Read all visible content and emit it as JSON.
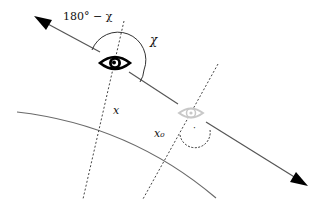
{
  "diagram": {
    "type": "geometry-illustration",
    "labels": {
      "supplement_angle": "180° − χ",
      "angle": "χ",
      "position": "x",
      "position_zero": "x₀",
      "right_angle_marker": "·"
    },
    "elements": {
      "observer_eye": "eye-icon",
      "faded_observer_eye": "eye-icon-faded",
      "line_of_sight": "arrow-line",
      "surface": "curve",
      "normal_at_x": "dotted-line",
      "normal_at_x0": "dotted-line"
    },
    "colors": {
      "line": "#555555",
      "arrowhead": "#000000",
      "eye": "#000000",
      "eye_faded": "#c8c8c8",
      "dotted": "#444444",
      "text": "#111111"
    }
  }
}
